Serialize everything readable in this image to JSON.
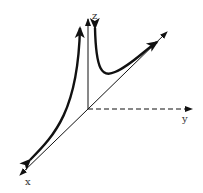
{
  "diagram": {
    "axes": {
      "x_label": "x",
      "y_label": "y",
      "z_label": "z"
    },
    "colors": {
      "line": "#111111",
      "background": "#ffffff"
    }
  }
}
